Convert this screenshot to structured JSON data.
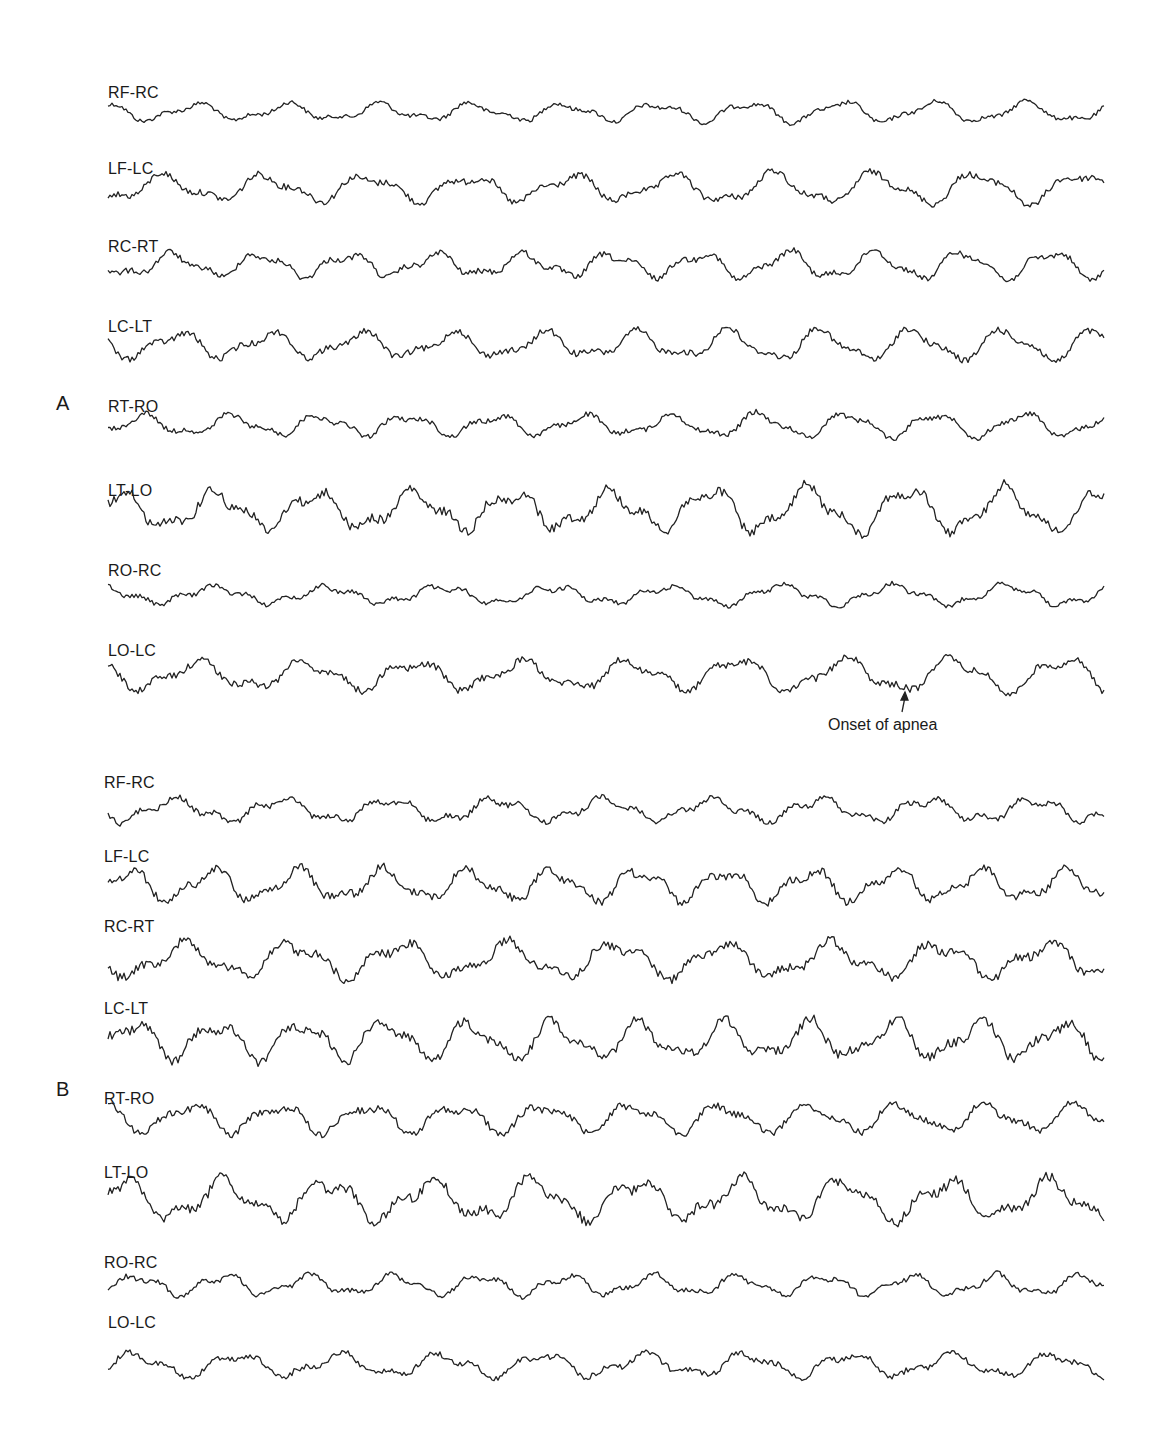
{
  "chart_data": {
    "type": "line",
    "title": "",
    "panels": [
      {
        "label": "A",
        "channels": [
          "RF-RC",
          "LF-LC",
          "RC-RT",
          "LC-LT",
          "RT-RO",
          "LT-LO",
          "RO-RC",
          "LO-LC"
        ],
        "baselines_y": [
          112,
          188,
          265,
          345,
          425,
          510,
          595,
          675
        ],
        "amplitudes": [
          12,
          18,
          16,
          18,
          14,
          26,
          12,
          20
        ],
        "annotation": {
          "text": "Onset of apnea",
          "channel": "LO-LC",
          "x": 905
        }
      },
      {
        "label": "B",
        "channels": [
          "RF-RC",
          "LF-LC",
          "RC-RT",
          "LC-LT",
          "RT-RO",
          "LT-LO",
          "RO-RC",
          "LO-LC"
        ],
        "baselines_y": [
          810,
          885,
          960,
          1040,
          1118,
          1200,
          1285,
          1365
        ],
        "amplitudes": [
          16,
          22,
          24,
          26,
          20,
          28,
          14,
          16
        ]
      }
    ],
    "x_range": [
      108,
      1105
    ],
    "grid": false,
    "legend": "none"
  },
  "panels": {
    "a": {
      "letter": "A",
      "labels": [
        "RF-RC",
        "LF-LC",
        "RC-RT",
        "LC-LT",
        "RT-RO",
        "LT-LO",
        "RO-RC",
        "LO-LC"
      ],
      "annotation": "Onset of apnea"
    },
    "b": {
      "letter": "B",
      "labels": [
        "RF-RC",
        "LF-LC",
        "RC-RT",
        "LC-LT",
        "RT-RO",
        "LT-LO",
        "RO-RC",
        "LO-LC"
      ]
    }
  }
}
